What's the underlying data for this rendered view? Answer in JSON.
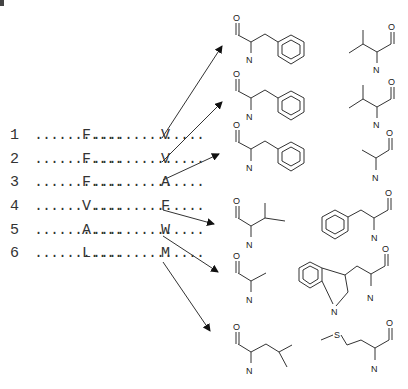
{
  "figure": {
    "type": "sequence-to-residue-structure mapping",
    "rows": [
      {
        "index": "1",
        "residue1": "F",
        "residue2": "V",
        "structure_left": "phenylalanine",
        "structure_right": "valine"
      },
      {
        "index": "2",
        "residue1": "F",
        "residue2": "V",
        "structure_left": "phenylalanine",
        "structure_right": "valine"
      },
      {
        "index": "3",
        "residue1": "F",
        "residue2": "A",
        "structure_left": "phenylalanine",
        "structure_right": "alanine"
      },
      {
        "index": "4",
        "residue1": "V",
        "residue2": "F",
        "structure_left": "valine",
        "structure_right": "phenylalanine"
      },
      {
        "index": "5",
        "residue1": "A",
        "residue2": "W",
        "structure_left": "alanine",
        "structure_right": "tryptophan"
      },
      {
        "index": "6",
        "residue1": "L",
        "residue2": "M",
        "structure_left": "leucine",
        "structure_right": "methionine"
      }
    ],
    "dots1": "...........",
    "dots2": "..............",
    "atom_labels": {
      "O": "O",
      "N": "N",
      "S": "S"
    },
    "colors": {
      "line": "#333333",
      "text": "#333333",
      "background": "#ffffff"
    }
  }
}
